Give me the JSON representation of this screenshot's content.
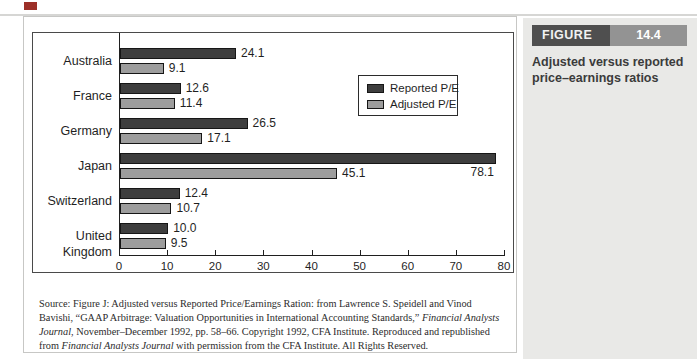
{
  "figure_label": {
    "word": "FIGURE",
    "number": "14.4"
  },
  "caption": "Adjusted versus reported price–earnings ratios",
  "chart_data": {
    "type": "bar",
    "orientation": "horizontal",
    "title": "",
    "xlabel": "",
    "ylabel": "",
    "categories": [
      "Australia",
      "France",
      "Germany",
      "Japan",
      "Switzerland",
      "United Kingdom"
    ],
    "series": [
      {
        "name": "Reported P/E",
        "color": "#3e3e3e",
        "values": [
          24.1,
          12.6,
          26.5,
          78.1,
          12.4,
          10.0
        ]
      },
      {
        "name": "Adjusted P/E",
        "color": "#9d9d9d",
        "values": [
          9.1,
          11.4,
          17.1,
          45.1,
          10.7,
          9.5
        ]
      }
    ],
    "xlim": [
      0,
      80
    ],
    "x_ticks": [
      "0",
      "10",
      "20",
      "30",
      "40",
      "50",
      "60",
      "70",
      "80"
    ],
    "grid": false,
    "legend_position": "upper-right-inside",
    "value_labels_shown": true
  },
  "source_note": {
    "segments": [
      {
        "text": "Source: Figure J: Adjusted versus Reported Price/Earnings Ration: from Lawrence S. Speidell and Vinod Bavishi, “GAAP Arbitrage: Valuation Opportunities in International Accounting Standards,” ",
        "italic": false
      },
      {
        "text": "Financial Analysts Journal",
        "italic": true
      },
      {
        "text": ", November–December 1992, pp. 58–66. Copyright 1992, CFA Institute. Reproduced and republished from ",
        "italic": false
      },
      {
        "text": "Financial Analysts Journal",
        "italic": true
      },
      {
        "text": " with permission from the CFA Institute. All Rights Reserved.",
        "italic": false
      }
    ]
  },
  "colors": {
    "reported_bar": "#3e3e3e",
    "adjusted_bar": "#9d9d9d",
    "bar_border": "#161616",
    "axis": "#1f1f1f",
    "margin_panel_bg": "#e9e9e7",
    "figure_word_bg": "#4f4f4f",
    "figure_num_bg": "#939393",
    "accent_mark": "#9c2f28"
  }
}
